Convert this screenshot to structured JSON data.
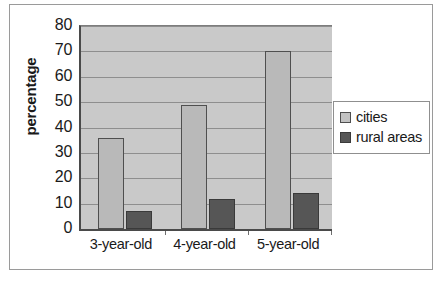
{
  "chart_data": {
    "type": "bar",
    "title": "",
    "xlabel": "",
    "ylabel": "percentage",
    "categories": [
      "3-year-old",
      "4-year-old",
      "5-year-old"
    ],
    "series": [
      {
        "name": "cities",
        "values": [
          36,
          49,
          70
        ],
        "color": "#b9b9b9"
      },
      {
        "name": "rural areas",
        "values": [
          7,
          12,
          14
        ],
        "color": "#565656"
      }
    ],
    "ylim": [
      0,
      80
    ],
    "ytick_values": [
      0,
      10,
      20,
      30,
      40,
      50,
      60,
      70,
      80
    ],
    "ytick_labels": [
      "0",
      "10",
      "20",
      "30",
      "40",
      "50",
      "60",
      "70",
      "80"
    ],
    "grid": true,
    "grid_axis": "y",
    "legend_position": "right",
    "plot_background": "#c9c9c9",
    "figure_background": "#ffffff"
  },
  "legend": {
    "entries": [
      {
        "label": "cities",
        "swatch": "legend-swatch-cities"
      },
      {
        "label": "rural areas",
        "swatch": "legend-swatch-rural-areas"
      }
    ]
  }
}
